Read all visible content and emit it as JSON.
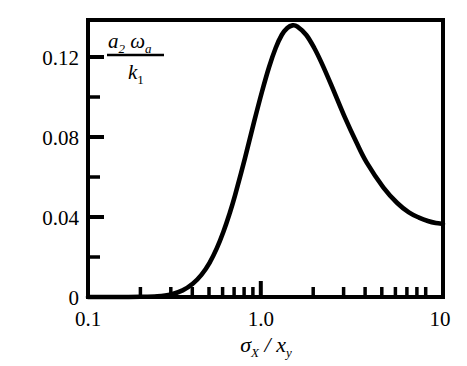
{
  "figure": {
    "background_color": "#ffffff",
    "line_color": "#000000",
    "axis_color": "#000000"
  },
  "axes": {
    "x": {
      "label_parts": {
        "sigma": "σ",
        "sigma_sub": "X",
        "slash": "/",
        "x": "x",
        "x_sub": "y"
      },
      "label_plain": "σX / xy",
      "scale": "log",
      "min": 0.1,
      "max": 11.0,
      "tick_labels": [
        "0.1",
        "1.0",
        "10"
      ],
      "tick_values": [
        0.1,
        1.0,
        10
      ]
    },
    "y": {
      "label_parts": {
        "numer_a": "a",
        "numer_a_sub": "2",
        "numer_omega": "ω",
        "numer_omega_sub": "a",
        "denom_k": "k",
        "denom_k_sub": "1"
      },
      "label_plain": "a2 ωa / k1",
      "scale": "linear",
      "min": 0,
      "max": 0.1385,
      "tick_labels": [
        "0",
        "0.04",
        "0.08",
        "0.12"
      ],
      "tick_values": [
        0,
        0.04,
        0.08,
        0.12
      ],
      "minor_tick_values": [
        0.02,
        0.06,
        0.1
      ]
    }
  },
  "chart_data": {
    "type": "line",
    "title": "",
    "subtitle": "",
    "xlabel": "σX / xy",
    "ylabel": "a2 ωa / k1",
    "xscale": "log",
    "yscale": "linear",
    "xlim": [
      0.1,
      11.0
    ],
    "ylim": [
      0,
      0.1385
    ],
    "grid": false,
    "legend": null,
    "xticks": [
      0.1,
      1.0,
      10
    ],
    "xticklabels": [
      "0.1",
      "1.0",
      "10"
    ],
    "yticks": [
      0,
      0.04,
      0.08,
      0.12
    ],
    "yticklabels": [
      "0",
      "0.04",
      "0.08",
      "0.12"
    ],
    "annotations": [],
    "series": [
      {
        "name": "a2 omega_a / k1",
        "x": [
          0.1,
          0.13,
          0.16,
          0.2,
          0.25,
          0.3,
          0.35,
          0.4,
          0.45,
          0.5,
          0.55,
          0.6,
          0.65,
          0.7,
          0.8,
          0.9,
          1.0,
          1.1,
          1.2,
          1.3,
          1.4,
          1.5,
          1.6,
          1.8,
          2.0,
          2.2,
          2.5,
          3.0,
          3.5,
          4.0,
          5.0,
          6.0,
          7.0,
          8.0,
          9.0,
          10.0,
          11.0
        ],
        "y": [
          0.0,
          0.0,
          0.0,
          0.0001,
          0.0004,
          0.0013,
          0.0033,
          0.0066,
          0.0112,
          0.0171,
          0.0243,
          0.0325,
          0.0414,
          0.0507,
          0.0696,
          0.0873,
          0.1025,
          0.115,
          0.1245,
          0.131,
          0.1345,
          0.1358,
          0.1352,
          0.131,
          0.1245,
          0.1172,
          0.1062,
          0.0898,
          0.0772,
          0.0673,
          0.0547,
          0.047,
          0.0423,
          0.0397,
          0.038,
          0.037,
          0.0366
        ]
      }
    ],
    "peak": {
      "x": 1.45,
      "y": 0.1358
    },
    "endpoint_right": {
      "x": 10.0,
      "y": 0.037
    }
  }
}
